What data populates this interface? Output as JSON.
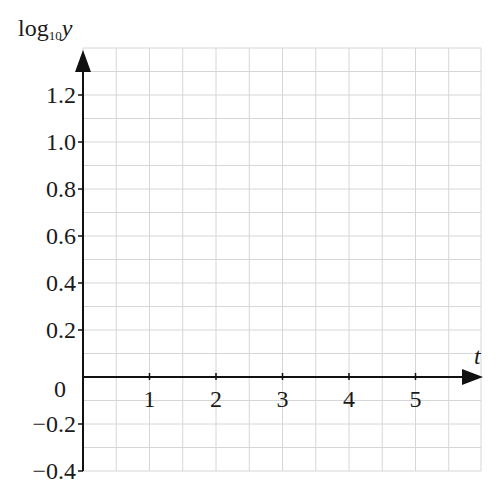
{
  "chart_data": {
    "type": "line",
    "title": "",
    "xlabel": "t",
    "ylabel_prefix": "log",
    "ylabel_subscript": "10",
    "ylabel_var": "y",
    "x_ticks": [
      1,
      2,
      3,
      4,
      5
    ],
    "x_tick_labels": [
      "1",
      "2",
      "3",
      "4",
      "5"
    ],
    "y_ticks": [
      1.2,
      1.0,
      0.8,
      0.6,
      0.4,
      0.2,
      0,
      -0.2,
      -0.4
    ],
    "y_tick_labels": [
      "1.2",
      "1.0",
      "0.8",
      "0.6",
      "0.4",
      "0.2",
      "0",
      "−0.2",
      "−0.4"
    ],
    "xlim": [
      0,
      6
    ],
    "ylim": [
      -0.4,
      1.4
    ],
    "grid": true,
    "grid_x_step": 0.5,
    "grid_y_step": 0.1,
    "series": [],
    "note": "Blank graph grid with axes only; no plotted data.",
    "colors": {
      "axis": "#111111",
      "grid": "#d6d6d6",
      "text": "#1a1a1a"
    }
  }
}
